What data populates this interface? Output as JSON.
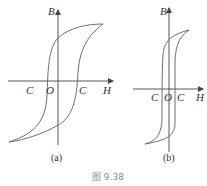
{
  "figure": {
    "caption": "图 9.38",
    "panels": [
      {
        "id": "a",
        "caption": "(a)",
        "axis_labels": {
          "y": "B",
          "x": "H"
        },
        "origin_label": "O",
        "coercive_labels": [
          "C",
          "C"
        ],
        "description": "Wide hysteresis loop (large coercivity)"
      },
      {
        "id": "b",
        "caption": "(b)",
        "axis_labels": {
          "y": "B",
          "x": "H"
        },
        "origin_label": "O",
        "coercive_labels": [
          "C",
          "C"
        ],
        "description": "Narrow hysteresis loop (small coercivity)"
      }
    ]
  },
  "colors": {
    "axis": "#444444",
    "curve": "#6e6e6e",
    "text": "#333333",
    "caption": "#8a8a8a"
  }
}
